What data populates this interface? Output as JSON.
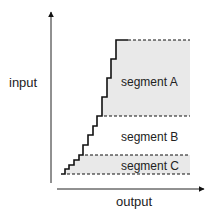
{
  "axes": {
    "y_label": "input",
    "x_label": "output"
  },
  "segments": [
    {
      "id": "A",
      "label": "segment A",
      "shaded": true
    },
    {
      "id": "B",
      "label": "segment B",
      "shaded": false
    },
    {
      "id": "C",
      "label": "segment C",
      "shaded": true
    }
  ],
  "colors": {
    "shade": "#e9e9e9",
    "line": "#111111"
  }
}
